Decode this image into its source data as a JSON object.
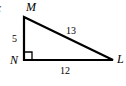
{
  "figure": {
    "prefix_fragment": ":",
    "background_color": "#ffffff",
    "stroke_color": "#000000"
  },
  "diagram": {
    "type": "right-triangle",
    "vertices": [
      {
        "id": "M",
        "label": "M",
        "x": 24,
        "y": 17,
        "position": "top-left"
      },
      {
        "id": "N",
        "label": "N",
        "x": 24,
        "y": 60,
        "position": "bottom-left",
        "right_angle": true
      },
      {
        "id": "L",
        "label": "L",
        "x": 113,
        "y": 60,
        "position": "bottom-right"
      }
    ],
    "sides": [
      {
        "id": "hypotenuse",
        "from": "M",
        "to": "L",
        "length_label": "13"
      },
      {
        "id": "vertical-leg",
        "from": "M",
        "to": "N",
        "length_label": "5"
      },
      {
        "id": "horizontal-leg",
        "from": "N",
        "to": "L",
        "length_label": "12"
      }
    ],
    "right_angle_marker": {
      "at": "N",
      "size": 8
    }
  }
}
